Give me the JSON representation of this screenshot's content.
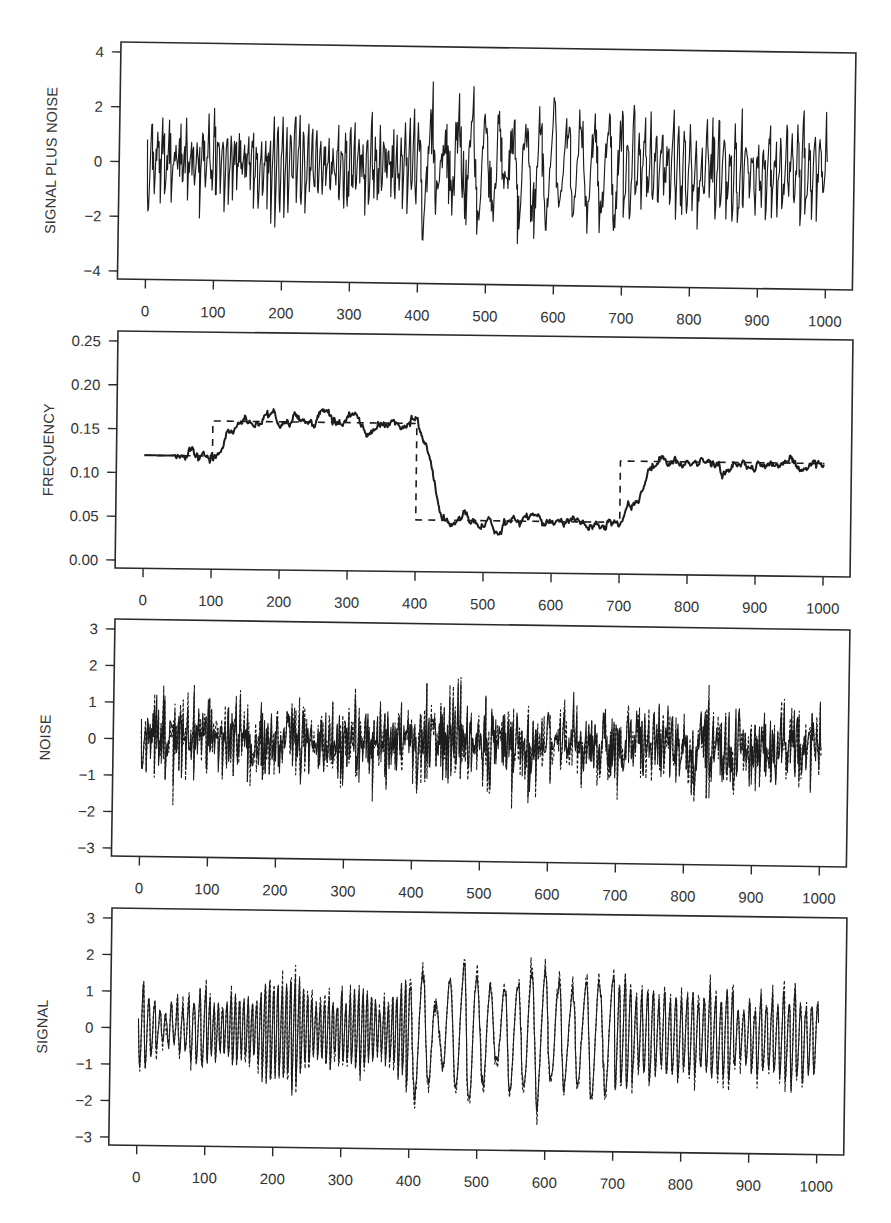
{
  "figure": {
    "layout": "4 stacked panels sharing x range 0-1000",
    "panel_count": 4
  },
  "chart_data": [
    {
      "id": "signal-plus-noise",
      "type": "line",
      "title": "",
      "xlabel": "",
      "ylabel": "SIGNAL PLUS NOISE",
      "xlim": [
        0,
        1000
      ],
      "ylim": [
        -4,
        4
      ],
      "xticks": [
        0,
        100,
        200,
        300,
        400,
        500,
        600,
        700,
        800,
        900,
        1000
      ],
      "xtick_labels": [
        "0",
        "100",
        "200",
        "300",
        "400",
        "500",
        "600",
        "700",
        "800",
        "900",
        "1000"
      ],
      "yticks": [
        -4,
        -2,
        0,
        2,
        4
      ],
      "ytick_labels": [
        "−4",
        "−2",
        "0",
        "2",
        "4"
      ],
      "grid": false,
      "legend": null,
      "series": [
        {
          "name": "signal plus noise",
          "style": "solid",
          "composition": "signal + noise",
          "approx_range": [
            -3.3,
            3.2
          ],
          "notable_points": [
            {
              "x": 212,
              "y": -3.1
            },
            {
              "x": 252,
              "y": 2.8
            },
            {
              "x": 365,
              "y": 3.2
            },
            {
              "x": 452,
              "y": -3.3
            },
            {
              "x": 565,
              "y": 2.9
            },
            {
              "x": 605,
              "y": 2.8
            },
            {
              "x": 650,
              "y": -2.9
            },
            {
              "x": 740,
              "y": -2.6
            },
            {
              "x": 880,
              "y": 2.9
            }
          ]
        }
      ]
    },
    {
      "id": "frequency",
      "type": "line",
      "title": "",
      "xlabel": "",
      "ylabel": "FREQUENCY",
      "xlim": [
        0,
        1000
      ],
      "ylim": [
        0,
        0.25
      ],
      "xticks": [
        0,
        100,
        200,
        300,
        400,
        500,
        600,
        700,
        800,
        900,
        1000
      ],
      "xtick_labels": [
        "0",
        "100",
        "200",
        "300",
        "400",
        "500",
        "600",
        "700",
        "800",
        "900",
        "1000"
      ],
      "yticks": [
        0,
        0.05,
        0.1,
        0.15,
        0.2,
        0.25
      ],
      "ytick_labels": [
        "0.00",
        "0.05",
        "0.10",
        "0.15",
        "0.20",
        "0.25"
      ],
      "grid": false,
      "legend": null,
      "series": [
        {
          "name": "estimated frequency",
          "style": "solid",
          "x_start": 0,
          "x_step": 10,
          "values": [
            0.12,
            0.12,
            0.12,
            0.12,
            0.12,
            0.121,
            0.122,
            0.126,
            0.116,
            0.12,
            0.119,
            0.123,
            0.142,
            0.15,
            0.158,
            0.16,
            0.156,
            0.158,
            0.168,
            0.165,
            0.15,
            0.156,
            0.164,
            0.158,
            0.155,
            0.16,
            0.176,
            0.17,
            0.163,
            0.156,
            0.168,
            0.172,
            0.152,
            0.15,
            0.152,
            0.16,
            0.158,
            0.158,
            0.154,
            0.157,
            0.164,
            0.14,
            0.12,
            0.078,
            0.05,
            0.046,
            0.05,
            0.052,
            0.05,
            0.048,
            0.046,
            0.048,
            0.032,
            0.048,
            0.05,
            0.052,
            0.05,
            0.056,
            0.052,
            0.048,
            0.054,
            0.05,
            0.05,
            0.049,
            0.05,
            0.046,
            0.044,
            0.047,
            0.048,
            0.053,
            0.048,
            0.062,
            0.07,
            0.082,
            0.104,
            0.115,
            0.121,
            0.119,
            0.122,
            0.118,
            0.117,
            0.118,
            0.119,
            0.12,
            0.122,
            0.11,
            0.117,
            0.121,
            0.119,
            0.115,
            0.118,
            0.116,
            0.12,
            0.122,
            0.118,
            0.12,
            0.114,
            0.116,
            0.122,
            0.119,
            0.117
          ]
        },
        {
          "name": "true frequency",
          "style": "dashed",
          "segments": [
            {
              "from": 0,
              "to": 100,
              "value": 0.12
            },
            {
              "from": 100,
              "to": 400,
              "value": 0.16
            },
            {
              "from": 400,
              "to": 700,
              "value": 0.05
            },
            {
              "from": 700,
              "to": 1000,
              "value": 0.12
            }
          ]
        }
      ]
    },
    {
      "id": "noise",
      "type": "line",
      "title": "",
      "xlabel": "",
      "ylabel": "NOISE",
      "xlim": [
        0,
        1000
      ],
      "ylim": [
        -3,
        3
      ],
      "xticks": [
        0,
        100,
        200,
        300,
        400,
        500,
        600,
        700,
        800,
        900,
        1000
      ],
      "xtick_labels": [
        "0",
        "100",
        "200",
        "300",
        "400",
        "500",
        "600",
        "700",
        "800",
        "900",
        "1000"
      ],
      "yticks": [
        -3,
        -2,
        -1,
        0,
        1,
        2,
        3
      ],
      "ytick_labels": [
        "−3",
        "−2",
        "−1",
        "0",
        "1",
        "2",
        "3"
      ],
      "grid": false,
      "legend": null,
      "series": [
        {
          "name": "estimated noise",
          "style": "solid",
          "approx_std": 0.55,
          "approx_range": [
            -2.3,
            1.9
          ],
          "notable_points": [
            {
              "x": 57,
              "y": -2.1
            },
            {
              "x": 210,
              "y": -2.2
            },
            {
              "x": 450,
              "y": -2.3
            },
            {
              "x": 740,
              "y": -2.2
            },
            {
              "x": 880,
              "y": 1.9
            }
          ]
        },
        {
          "name": "true noise",
          "style": "dashed",
          "approx_range": [
            -2.4,
            2.2
          ],
          "notable_points": [
            {
              "x": 365,
              "y": 2.2
            }
          ]
        }
      ]
    },
    {
      "id": "signal",
      "type": "line",
      "title": "",
      "xlabel": "",
      "ylabel": "SIGNAL",
      "xlim": [
        0,
        1000
      ],
      "ylim": [
        -3,
        3
      ],
      "xticks": [
        0,
        100,
        200,
        300,
        400,
        500,
        600,
        700,
        800,
        900,
        1000
      ],
      "xtick_labels": [
        "0",
        "100",
        "200",
        "300",
        "400",
        "500",
        "600",
        "700",
        "800",
        "900",
        "1000"
      ],
      "yticks": [
        -3,
        -2,
        -1,
        0,
        1,
        2,
        3
      ],
      "ytick_labels": [
        "−3",
        "−2",
        "−1",
        "0",
        "1",
        "2",
        "3"
      ],
      "grid": false,
      "legend": null,
      "series": [
        {
          "name": "estimated signal",
          "style": "solid",
          "segments": [
            {
              "from": 0,
              "to": 400,
              "amplitude": 1.0
            },
            {
              "from": 400,
              "to": 700,
              "amplitude": 1.4
            },
            {
              "from": 700,
              "to": 1000,
              "amplitude": 1.15
            }
          ],
          "notable_points": [
            {
              "x": 365,
              "y": 1.9
            },
            {
              "x": 368,
              "y": -1.7
            },
            {
              "x": 455,
              "y": -1.95
            },
            {
              "x": 565,
              "y": 1.7
            },
            {
              "x": 650,
              "y": -1.9
            }
          ]
        },
        {
          "name": "true signal",
          "style": "dashed"
        }
      ]
    }
  ]
}
